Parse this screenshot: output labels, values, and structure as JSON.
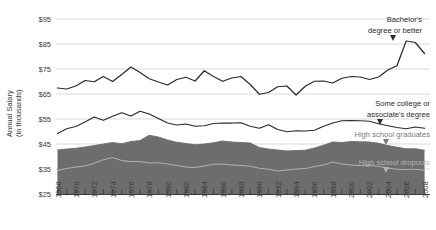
{
  "chart_data": {
    "type": "line",
    "title": "",
    "xlabel": "",
    "ylabel": "Annual Salary\n(in thousands)",
    "ylabel_line1": "Annual Salary",
    "ylabel_line2": "(in thousands)",
    "ylim": [
      25,
      95
    ],
    "ytick_labels": [
      "$95",
      "$85",
      "$75",
      "$65",
      "$55",
      "$45",
      "$35",
      "$25"
    ],
    "ytick_values": [
      95,
      85,
      75,
      65,
      55,
      45,
      35,
      25
    ],
    "grid": true,
    "legend_position": "inline-annotations",
    "xlim": [
      1968,
      2008
    ],
    "x": [
      1968,
      1969,
      1970,
      1971,
      1972,
      1973,
      1974,
      1975,
      1976,
      1977,
      1978,
      1979,
      1980,
      1981,
      1982,
      1983,
      1984,
      1985,
      1986,
      1987,
      1988,
      1989,
      1990,
      1991,
      1992,
      1993,
      1994,
      1995,
      1996,
      1997,
      1998,
      1999,
      2000,
      2001,
      2002,
      2003,
      2004,
      2005,
      2006,
      2007,
      2008
    ],
    "xtick_labels": [
      "1968",
      "1970",
      "1972",
      "1974",
      "1976",
      "1978",
      "1980",
      "1982",
      "1984",
      "1986",
      "1988",
      "1990",
      "1992",
      "1994",
      "1996",
      "1998",
      "2000",
      "2002",
      "2004",
      "2006",
      "2008"
    ],
    "series": [
      {
        "name": "Bachelor's degree or better",
        "color": "#2b2b2b",
        "fill": "none",
        "annotation": "Bachelor's\ndegree or better",
        "annotation_line1": "Bachelor's",
        "annotation_line2": "degree or better",
        "values": [
          67.4,
          67.0,
          68.2,
          70.4,
          69.9,
          72.0,
          70.0,
          72.8,
          75.8,
          73.6,
          71.1,
          69.8,
          68.6,
          70.8,
          71.7,
          70.2,
          74.3,
          72.0,
          70.1,
          71.4,
          72.0,
          68.8,
          64.9,
          65.6,
          67.9,
          68.2,
          64.6,
          68.1,
          70.1,
          70.2,
          69.4,
          71.3,
          72.0,
          71.8,
          70.8,
          71.8,
          74.6,
          76.3,
          86.2,
          85.6,
          81.2
        ]
      },
      {
        "name": "Some college or associate's degree",
        "color": "#2b2b2b",
        "fill": "none",
        "annotation": "Some college or\nassociate's degree",
        "annotation_line1": "Some college or",
        "annotation_line2": "associate's degree",
        "values": [
          49.2,
          51.1,
          52.0,
          53.8,
          55.8,
          54.5,
          56.1,
          57.5,
          56.2,
          58.1,
          57.0,
          55.2,
          53.4,
          52.6,
          53.0,
          52.1,
          52.3,
          53.2,
          53.4,
          53.4,
          53.5,
          52.1,
          51.3,
          52.7,
          50.8,
          49.9,
          50.3,
          50.2,
          50.5,
          52.1,
          53.4,
          54.3,
          54.4,
          54.3,
          54.1,
          53.1,
          52.3,
          51.6,
          51.1,
          51.8,
          51.3
        ]
      },
      {
        "name": "High school graduates",
        "color": "#6d6d6d",
        "fill": "#6d6d6d",
        "annotation": "High school graduates",
        "annotation_line1": "High school graduates",
        "values": [
          42.6,
          43.0,
          43.3,
          43.8,
          44.4,
          45.0,
          45.6,
          45.1,
          46.0,
          46.4,
          48.5,
          47.8,
          46.6,
          45.7,
          45.2,
          44.7,
          45.0,
          45.5,
          46.2,
          45.8,
          45.6,
          45.4,
          43.6,
          43.0,
          42.6,
          42.2,
          42.4,
          42.5,
          43.4,
          44.5,
          45.8,
          45.6,
          46.0,
          45.9,
          45.8,
          45.3,
          44.4,
          43.7,
          43.1,
          43.1,
          42.5
        ]
      },
      {
        "name": "High school dropouts",
        "color": "#b9b9b9",
        "fill": "#c3c3c3",
        "annotation": "High school dropouts",
        "annotation_line1": "High school dropouts",
        "values": [
          34.4,
          35.2,
          35.8,
          36.2,
          37.3,
          38.7,
          39.6,
          38.4,
          38.0,
          38.0,
          37.4,
          37.5,
          37.0,
          36.4,
          35.8,
          35.6,
          36.2,
          36.9,
          37.0,
          36.6,
          36.4,
          36.1,
          35.3,
          34.9,
          34.2,
          34.6,
          35.0,
          35.2,
          36.0,
          36.6,
          37.8,
          37.0,
          36.6,
          36.3,
          36.5,
          36.0,
          35.4,
          34.9,
          34.8,
          34.9,
          34.5
        ]
      }
    ]
  }
}
